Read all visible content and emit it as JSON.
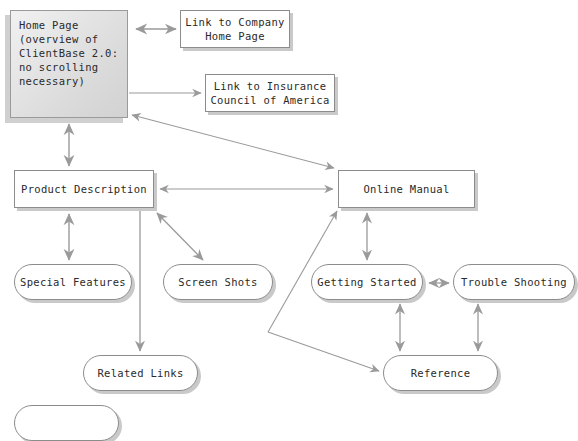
{
  "diagram": {
    "colors": {
      "node_border": "#8c8c8c",
      "node_fill": "#ffffff",
      "node_shadow": "#c9c9c9",
      "edge": "#9a9a9a",
      "text": "#2a2a2a",
      "home_fill_light": "#f1f1f1",
      "home_fill_dark": "#d2d2d2",
      "background": "#ffffff"
    },
    "nodes": [
      {
        "id": "home-page",
        "label": "Home Page\n(overview of\nClientBase 2.0:\nno scrolling\nnecessary)",
        "shape": "rect-gradient",
        "x": 10,
        "y": 10,
        "w": 118,
        "h": 108
      },
      {
        "id": "link-company-home",
        "label": "Link to Company\nHome Page",
        "shape": "rect",
        "x": 180,
        "y": 10,
        "w": 110,
        "h": 38
      },
      {
        "id": "link-insurance-council",
        "label": "Link to Insurance\nCouncil of America",
        "shape": "rect",
        "x": 205,
        "y": 74,
        "w": 130,
        "h": 38
      },
      {
        "id": "product-description",
        "label": "Product Description",
        "shape": "rect",
        "x": 14,
        "y": 170,
        "w": 140,
        "h": 38
      },
      {
        "id": "online-manual",
        "label": "Online Manual",
        "shape": "rect",
        "x": 338,
        "y": 170,
        "w": 137,
        "h": 38
      },
      {
        "id": "special-features",
        "label": "Special Features",
        "shape": "round",
        "x": 14,
        "y": 264,
        "w": 118,
        "h": 36
      },
      {
        "id": "screen-shots",
        "label": "Screen Shots",
        "shape": "round",
        "x": 163,
        "y": 264,
        "w": 110,
        "h": 36
      },
      {
        "id": "getting-started",
        "label": "Getting Started",
        "shape": "round",
        "x": 311,
        "y": 264,
        "w": 112,
        "h": 36
      },
      {
        "id": "trouble-shooting",
        "label": "Trouble Shooting",
        "shape": "round",
        "x": 453,
        "y": 264,
        "w": 122,
        "h": 36
      },
      {
        "id": "related-links",
        "label": "Related Links",
        "shape": "round",
        "x": 83,
        "y": 355,
        "w": 115,
        "h": 36
      },
      {
        "id": "reference",
        "label": "Reference",
        "shape": "round",
        "x": 383,
        "y": 355,
        "w": 115,
        "h": 36
      },
      {
        "id": "bottom-partial",
        "label": "",
        "shape": "round-clipped",
        "x": 14,
        "y": 405,
        "w": 105,
        "h": 36
      }
    ],
    "edges": [
      {
        "id": "home-to-company-link",
        "from": "home-page",
        "to": "link-company-home",
        "arrows": "both"
      },
      {
        "id": "home-to-insurance-link",
        "from": "home-page",
        "to": "link-insurance-council",
        "arrows": "end"
      },
      {
        "id": "home-to-product-description",
        "from": "home-page",
        "to": "product-description",
        "arrows": "both"
      },
      {
        "id": "home-to-online-manual",
        "from": "home-page",
        "to": "online-manual",
        "arrows": "both"
      },
      {
        "id": "product-description-to-online-manual",
        "from": "product-description",
        "to": "online-manual",
        "arrows": "both"
      },
      {
        "id": "product-description-to-special-features",
        "from": "product-description",
        "to": "special-features",
        "arrows": "both"
      },
      {
        "id": "product-description-to-screen-shots",
        "from": "product-description",
        "to": "screen-shots",
        "arrows": "both"
      },
      {
        "id": "product-description-to-related-links",
        "from": "product-description",
        "to": "related-links",
        "arrows": "end"
      },
      {
        "id": "online-manual-to-getting-started",
        "from": "online-manual",
        "to": "getting-started",
        "arrows": "both"
      },
      {
        "id": "getting-started-to-trouble-shooting",
        "from": "getting-started",
        "to": "trouble-shooting",
        "arrows": "both"
      },
      {
        "id": "getting-started-to-reference",
        "from": "getting-started",
        "to": "reference",
        "arrows": "both"
      },
      {
        "id": "trouble-shooting-to-reference",
        "from": "trouble-shooting",
        "to": "reference",
        "arrows": "both"
      },
      {
        "id": "online-manual-to-reference",
        "from": "online-manual",
        "to": "reference",
        "arrows": "both"
      }
    ]
  }
}
